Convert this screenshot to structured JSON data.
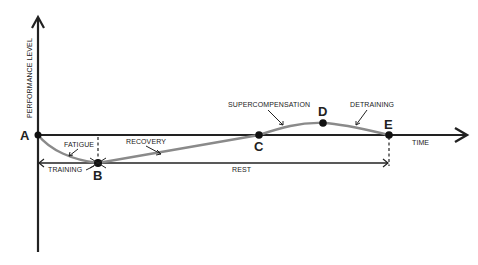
{
  "diagram": {
    "y_axis_label": "PERFORMANCE LEVEL",
    "x_axis_label": "TIME",
    "points": [
      {
        "id": "A",
        "label": "A"
      },
      {
        "id": "B",
        "label": "B"
      },
      {
        "id": "C",
        "label": "C"
      },
      {
        "id": "D",
        "label": "D"
      },
      {
        "id": "E",
        "label": "E"
      }
    ],
    "phase_labels": {
      "fatigue": "FATIGUE",
      "recovery": "RECOVERY",
      "supercompensation": "SUPERCOMPENSATION",
      "detraining": "DETRAINING"
    },
    "interval_labels": {
      "training": "TRAINING",
      "rest": "REST"
    },
    "colors": {
      "axis": "#222222",
      "curve": "#8a8a8a",
      "point": "#111111"
    }
  }
}
